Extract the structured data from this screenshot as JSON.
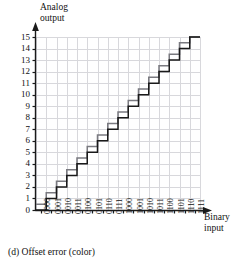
{
  "figure": {
    "caption": "(d) Offset error (color)",
    "y_axis_title": "Analog\noutput",
    "x_axis_title": "Binary\ninput"
  },
  "chart_data": {
    "type": "line",
    "title": "(d) Offset error (color)",
    "xlabel": "Binary input",
    "ylabel": "Analog output",
    "grid": true,
    "legend_position": "none",
    "xlim": [
      0,
      16
    ],
    "ylim": [
      0,
      15
    ],
    "categories": [
      "0000",
      "0001",
      "0010",
      "0011",
      "0100",
      "0101",
      "0110",
      "0111",
      "1000",
      "1001",
      "1010",
      "1011",
      "1100",
      "1101",
      "1110",
      "1111"
    ],
    "yticks": [
      0,
      1,
      2,
      3,
      4,
      5,
      6,
      7,
      8,
      9,
      10,
      11,
      12,
      13,
      14,
      15
    ],
    "series": [
      {
        "name": "Ideal transfer characteristic",
        "color": "#1a1a1a",
        "style": "staircase",
        "values": [
          0,
          1,
          2,
          3,
          4,
          5,
          6,
          7,
          8,
          9,
          10,
          11,
          12,
          13,
          14,
          15
        ]
      },
      {
        "name": "Offset error (color)",
        "color": "#7a7a80",
        "style": "staircase",
        "offset_lsb": 0.5,
        "values": [
          0.5,
          1.5,
          2.5,
          3.5,
          4.5,
          5.5,
          6.5,
          7.5,
          8.5,
          9.5,
          10.5,
          11.5,
          12.5,
          13.5,
          14.5,
          15
        ]
      }
    ],
    "annotations": []
  },
  "colors": {
    "grid": "#d8d8dc",
    "axis": "#1a1a1a",
    "ideal_curve": "#1a1a1a",
    "offset_curve": "#7a7a80"
  }
}
